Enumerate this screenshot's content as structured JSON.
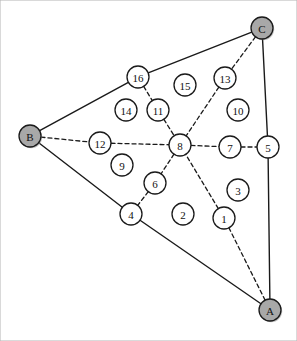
{
  "figure": {
    "name": "triangle-graph-diagram",
    "width": 297,
    "height": 341,
    "background_color": "#ffffff",
    "border_color": "#b4b4b4"
  },
  "style": {
    "node_fill": "#ffffff",
    "node_stroke": "#1a1a1a",
    "vertex_fill": "#a8a8a8",
    "vertex_stroke": "#1a1a1a",
    "solid_edge_color": "#1a1a1a",
    "dashed_edge_color": "#1a1a1a",
    "label_color": "#111111",
    "node_radius": 11,
    "vertex_radius": 11,
    "solid_width": 1.4,
    "dashed_width": 1.3,
    "dash_pattern": "4,3"
  },
  "chart_data": {
    "type": "diagram-graph",
    "title": "",
    "xlabel": "",
    "ylabel": "",
    "xlim": [
      0,
      297
    ],
    "ylim": [
      0,
      341
    ],
    "grid": false,
    "legend": "none",
    "vertices": [
      {
        "id": "A",
        "label": "A",
        "x": 270,
        "y": 310,
        "kind": "corner"
      },
      {
        "id": "B",
        "label": "B",
        "x": 30,
        "y": 136,
        "kind": "corner"
      },
      {
        "id": "C",
        "label": "C",
        "x": 262,
        "y": 28,
        "kind": "corner"
      }
    ],
    "nodes": [
      {
        "id": "1",
        "label": "1",
        "x": 224,
        "y": 218
      },
      {
        "id": "2",
        "label": "2",
        "x": 183,
        "y": 214
      },
      {
        "id": "3",
        "label": "3",
        "x": 238,
        "y": 190
      },
      {
        "id": "4",
        "label": "4",
        "x": 131,
        "y": 214
      },
      {
        "id": "5",
        "label": "5",
        "x": 268,
        "y": 147
      },
      {
        "id": "6",
        "label": "6",
        "x": 155,
        "y": 183
      },
      {
        "id": "7",
        "label": "7",
        "x": 230,
        "y": 147
      },
      {
        "id": "8",
        "label": "8",
        "x": 180,
        "y": 145
      },
      {
        "id": "9",
        "label": "9",
        "x": 122,
        "y": 165
      },
      {
        "id": "10",
        "label": "10",
        "x": 238,
        "y": 110
      },
      {
        "id": "11",
        "label": "11",
        "x": 158,
        "y": 110
      },
      {
        "id": "12",
        "label": "12",
        "x": 100,
        "y": 143
      },
      {
        "id": "13",
        "label": "13",
        "x": 225,
        "y": 78
      },
      {
        "id": "14",
        "label": "14",
        "x": 126,
        "y": 110
      },
      {
        "id": "15",
        "label": "15",
        "x": 185,
        "y": 85
      },
      {
        "id": "16",
        "label": "16",
        "x": 138,
        "y": 77
      }
    ],
    "solid_edges": [
      {
        "from": "B",
        "to": "16"
      },
      {
        "from": "16",
        "to": "C"
      },
      {
        "from": "B",
        "to": "4"
      },
      {
        "from": "4",
        "to": "A"
      },
      {
        "from": "C",
        "to": "5"
      },
      {
        "from": "5",
        "to": "A"
      }
    ],
    "dashed_edges": [
      {
        "from": "B",
        "to": "12"
      },
      {
        "from": "12",
        "to": "8"
      },
      {
        "from": "C",
        "to": "13"
      },
      {
        "from": "13",
        "to": "8"
      },
      {
        "from": "A",
        "to": "1"
      },
      {
        "from": "1",
        "to": "8"
      },
      {
        "from": "8",
        "to": "7"
      },
      {
        "from": "7",
        "to": "5"
      },
      {
        "from": "16",
        "to": "11"
      },
      {
        "from": "11",
        "to": "8"
      },
      {
        "from": "8",
        "to": "6"
      },
      {
        "from": "6",
        "to": "4"
      }
    ]
  }
}
